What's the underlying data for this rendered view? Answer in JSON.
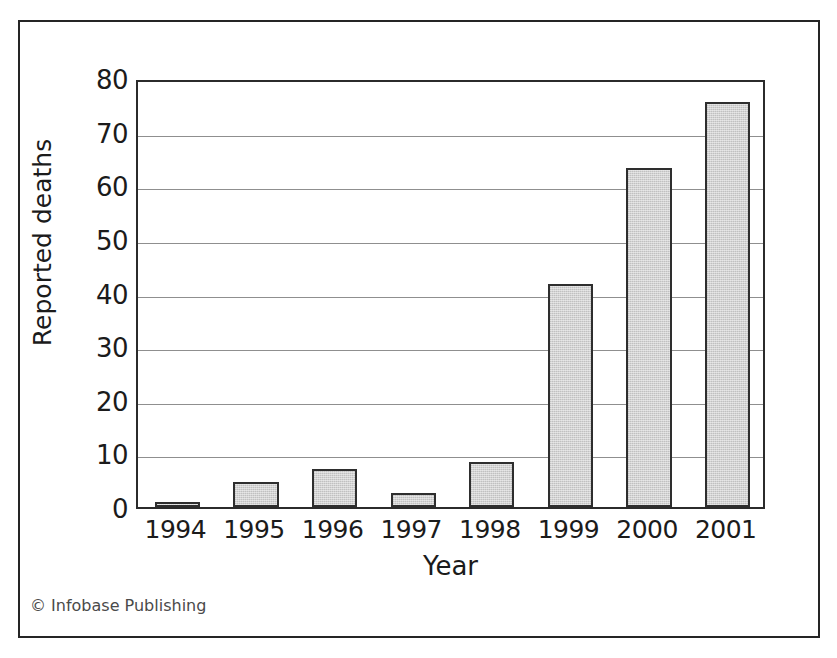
{
  "figure": {
    "credit": "© Infobase Publishing",
    "frame_color": "#252525",
    "bar_fill_color": "#d2d2d2",
    "bar_edge_color": "#2e2e2e",
    "gridline_color": "#8f8f8f",
    "background_color": "#ffffff"
  },
  "chart_data": {
    "type": "bar",
    "title": "",
    "subtitle": "",
    "xlabel": "Year",
    "ylabel": "Reported deaths",
    "categories": [
      "1994",
      "1995",
      "1996",
      "1997",
      "1998",
      "1999",
      "2000",
      "2001"
    ],
    "values": [
      1,
      4.7,
      7.1,
      2.6,
      8.4,
      41.5,
      63.3,
      75.5
    ],
    "ylim": [
      0,
      80
    ],
    "yticks": [
      0,
      10,
      20,
      30,
      40,
      50,
      60,
      70,
      80
    ],
    "ytick_labels": [
      "0",
      "10",
      "20",
      "30",
      "40",
      "50",
      "60",
      "70",
      "80"
    ],
    "grid": true,
    "grid_axis": "y",
    "legend": false,
    "legend_position": "none",
    "annotations": []
  }
}
